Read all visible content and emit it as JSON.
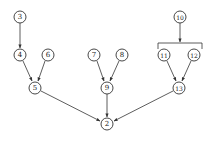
{
  "diagram": {
    "type": "tree-dag",
    "nodes": [
      {
        "id": "n3",
        "label": "3",
        "x": 20,
        "y": 17
      },
      {
        "id": "n4",
        "label": "4",
        "x": 20,
        "y": 55
      },
      {
        "id": "n6",
        "label": "6",
        "x": 48,
        "y": 55
      },
      {
        "id": "n5",
        "label": "5",
        "x": 35,
        "y": 88
      },
      {
        "id": "n7",
        "label": "7",
        "x": 94,
        "y": 55
      },
      {
        "id": "n8",
        "label": "8",
        "x": 122,
        "y": 55
      },
      {
        "id": "n9",
        "label": "9",
        "x": 107,
        "y": 88
      },
      {
        "id": "n10",
        "label": "10",
        "x": 180,
        "y": 17
      },
      {
        "id": "n11",
        "label": "11",
        "x": 164,
        "y": 55
      },
      {
        "id": "n12",
        "label": "12",
        "x": 194,
        "y": 55
      },
      {
        "id": "n13",
        "label": "13",
        "x": 179,
        "y": 88
      },
      {
        "id": "n2",
        "label": "2",
        "x": 107,
        "y": 124
      }
    ],
    "edges": [
      {
        "from": "3",
        "to": "4"
      },
      {
        "from": "4",
        "to": "5"
      },
      {
        "from": "6",
        "to": "5"
      },
      {
        "from": "7",
        "to": "9"
      },
      {
        "from": "8",
        "to": "9"
      },
      {
        "from": "10",
        "to": "11,12 (bracket)"
      },
      {
        "from": "11",
        "to": "13"
      },
      {
        "from": "12",
        "to": "13"
      },
      {
        "from": "5",
        "to": "2"
      },
      {
        "from": "9",
        "to": "2"
      },
      {
        "from": "13",
        "to": "2"
      }
    ]
  }
}
